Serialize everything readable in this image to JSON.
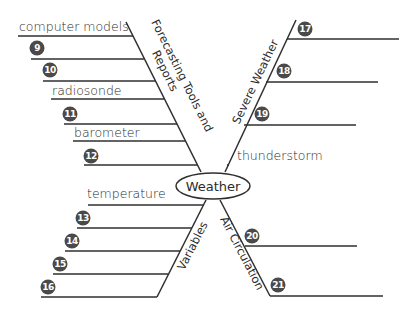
{
  "center": {
    "label": "Weather"
  },
  "branches": {
    "forecasting": {
      "label_line1": "Forecasting Tools and",
      "label_line2": "Reports",
      "items": [
        {
          "type": "text",
          "value": "computer models"
        },
        {
          "type": "blank",
          "number": "9"
        },
        {
          "type": "blank",
          "number": "10"
        },
        {
          "type": "text",
          "value": "radiosonde"
        },
        {
          "type": "blank",
          "number": "11"
        },
        {
          "type": "text",
          "value": "barometer"
        },
        {
          "type": "blank",
          "number": "12"
        }
      ]
    },
    "severe_weather": {
      "label": "Severe Weather",
      "items": [
        {
          "type": "blank",
          "number": "17"
        },
        {
          "type": "blank",
          "number": "18"
        },
        {
          "type": "blank",
          "number": "19"
        },
        {
          "type": "text",
          "value": "thunderstorm"
        }
      ]
    },
    "variables": {
      "label": "Variables",
      "items": [
        {
          "type": "text",
          "value": "temperature"
        },
        {
          "type": "blank",
          "number": "13"
        },
        {
          "type": "blank",
          "number": "14"
        },
        {
          "type": "blank",
          "number": "15"
        },
        {
          "type": "blank",
          "number": "16"
        }
      ]
    },
    "air_circulation": {
      "label": "Air Circulation",
      "items": [
        {
          "type": "blank",
          "number": "20"
        },
        {
          "type": "blank",
          "number": "21"
        }
      ]
    }
  },
  "colors": {
    "line": "#2f2f2f",
    "badge": "#4a4a4a",
    "text": "#2b2b2b"
  }
}
